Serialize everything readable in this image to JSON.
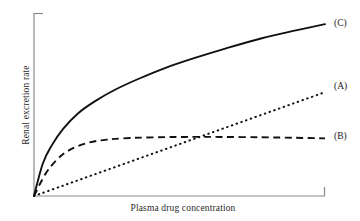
{
  "chart_data": {
    "type": "line",
    "title": "",
    "subtitle": "",
    "xlabel": "Plasma drug concentration",
    "ylabel": "Renal excretion rate",
    "xlim": [
      0,
      100
    ],
    "ylim": [
      0,
      100
    ],
    "grid": false,
    "axis_ticks": false,
    "legend_position": "right-inline",
    "annotations": [
      {
        "text": "(A)",
        "series": "A",
        "x": 100,
        "y": 58
      },
      {
        "text": "(B)",
        "series": "B",
        "x": 100,
        "y": 32
      },
      {
        "text": "(C)",
        "series": "C",
        "x": 100,
        "y": 93
      }
    ],
    "series": [
      {
        "name": "A",
        "label": "(A)",
        "style": "dotted",
        "color": "#111111",
        "description": "passive filtration only — linear, proportional to concentration",
        "x": [
          0,
          10,
          20,
          30,
          40,
          50,
          60,
          70,
          80,
          90,
          100
        ],
        "y": [
          0,
          5.8,
          11.6,
          17.4,
          23.2,
          29.0,
          34.8,
          40.6,
          46.4,
          52.2,
          58.0
        ]
      },
      {
        "name": "B",
        "label": "(B)",
        "style": "dashed",
        "color": "#111111",
        "description": "filtration plus saturable active secretion that plateaus",
        "x": [
          0,
          4,
          8,
          12,
          18,
          25,
          33,
          42,
          52,
          64,
          78,
          90,
          100
        ],
        "y": [
          0,
          12.5,
          20.5,
          25.5,
          29.5,
          31.5,
          32.4,
          32.8,
          33.0,
          33.0,
          32.8,
          32.5,
          32.2
        ]
      },
      {
        "name": "C",
        "label": "(C)",
        "style": "solid",
        "color": "#111111",
        "description": "filtration plus active secretion — continues to rise",
        "x": [
          0,
          3,
          6,
          10,
          15,
          21,
          28,
          36,
          45,
          55,
          66,
          78,
          90,
          100
        ],
        "y": [
          0,
          18.0,
          28.0,
          37.5,
          46.0,
          53.0,
          59.5,
          65.5,
          71.5,
          77.0,
          82.5,
          88.0,
          92.5,
          96.0
        ]
      }
    ]
  },
  "style": {
    "axis_color": "#8a8a8a",
    "curve_color": "#111111",
    "background": "#ffffff"
  }
}
